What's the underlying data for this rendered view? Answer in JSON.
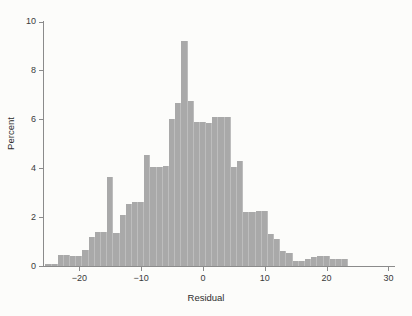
{
  "chart_data": {
    "type": "bar",
    "title": "",
    "xlabel": "Residual",
    "ylabel": "Percent",
    "xlim": [
      -25.5,
      31.0
    ],
    "ylim": [
      0,
      10.4
    ],
    "grid": false,
    "legend": "none",
    "bar_color": "#a9a9a9",
    "bin_width": 1,
    "x_ticks": [
      -20,
      -10,
      0,
      10,
      20,
      30
    ],
    "x_tick_labels": [
      "−20",
      "−10",
      "0",
      "10",
      "20",
      "30"
    ],
    "y_ticks": [
      0,
      2,
      4,
      6,
      8,
      10
    ],
    "y_tick_labels": [
      "0",
      "2",
      "4",
      "6",
      "8",
      "10"
    ],
    "categories": [
      -25.5,
      -24.5,
      -23.5,
      -22.5,
      -21.5,
      -20.5,
      -19.5,
      -18.5,
      -17.5,
      -16.5,
      -15.5,
      -14.5,
      -13.5,
      -12.5,
      -11.5,
      -10.5,
      -9.5,
      -8.5,
      -7.5,
      -6.5,
      -5.5,
      -4.5,
      -3.5,
      -2.5,
      -1.5,
      -0.5,
      0.5,
      1.5,
      2.5,
      3.5,
      4.5,
      5.5,
      6.5,
      7.5,
      8.5,
      9.5,
      10.5,
      11.5,
      12.5,
      13.5,
      14.5,
      15.5,
      16.5,
      17.5,
      18.5,
      19.5,
      20.5,
      21.5,
      22.5,
      23.5,
      24.5,
      25.5
    ],
    "values": [
      0.08,
      0.08,
      0.45,
      0.45,
      0.42,
      0.42,
      0.65,
      1.2,
      1.4,
      1.4,
      3.65,
      1.35,
      2.1,
      2.55,
      2.6,
      2.6,
      4.55,
      4.05,
      4.05,
      4.1,
      6.0,
      6.65,
      9.2,
      6.75,
      5.9,
      5.9,
      5.85,
      6.1,
      6.1,
      6.1,
      4.05,
      4.3,
      2.2,
      2.2,
      2.25,
      2.25,
      1.3,
      1.1,
      0.6,
      0.55,
      0.2,
      0.2,
      0.3,
      0.35,
      0.4,
      0.4,
      0.28,
      0.28,
      0.28,
      0.0,
      0.0,
      0.0
    ]
  },
  "axes": {
    "x_title": "Residual",
    "y_title": "Percent"
  }
}
